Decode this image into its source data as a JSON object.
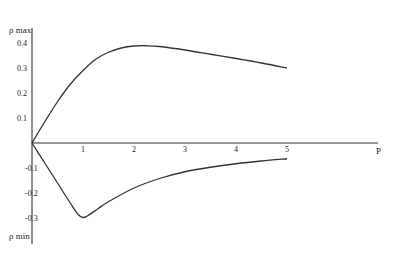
{
  "chart_data": {
    "type": "line",
    "title": "",
    "xlabel": "P",
    "ylabel_top": "ρ max",
    "ylabel_bottom": "ρ min",
    "xlim": [
      0,
      5.8
    ],
    "ylim": [
      -0.42,
      0.47
    ],
    "x_ticks": [
      "1",
      "2",
      "3",
      "4",
      "5"
    ],
    "y_ticks": [
      "0.4",
      "0.3",
      "0.2",
      "0.1",
      "-0.1",
      "-0.2",
      "-0.3"
    ],
    "grid": false,
    "legend": null,
    "series": [
      {
        "name": "ρ max",
        "x": [
          0,
          0.25,
          0.5,
          0.75,
          1.0,
          1.25,
          1.5,
          1.75,
          2.0,
          2.25,
          2.5,
          3.0,
          3.5,
          4.0,
          4.5,
          5.0
        ],
        "y": [
          0,
          0.085,
          0.165,
          0.235,
          0.29,
          0.335,
          0.363,
          0.38,
          0.388,
          0.389,
          0.386,
          0.372,
          0.355,
          0.338,
          0.32,
          0.3
        ]
      },
      {
        "name": "ρ min",
        "x": [
          0,
          0.25,
          0.5,
          0.75,
          0.9,
          1.0,
          1.1,
          1.3,
          1.5,
          2.0,
          2.5,
          3.0,
          3.5,
          4.0,
          4.5,
          5.0
        ],
        "y": [
          0,
          -0.08,
          -0.16,
          -0.24,
          -0.285,
          -0.298,
          -0.29,
          -0.262,
          -0.235,
          -0.18,
          -0.142,
          -0.115,
          -0.097,
          -0.083,
          -0.072,
          -0.063
        ]
      }
    ]
  },
  "labels": {
    "ylabel_top": "ρ  max",
    "ylabel_bottom": "ρ  min",
    "xlabel": "P"
  }
}
